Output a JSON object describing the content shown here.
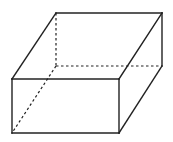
{
  "diagram": {
    "type": "cuboid-wireframe",
    "colors": {
      "background": "#ffffff",
      "stroke": "#222222"
    },
    "vertices": {
      "front_top_left": [
        12,
        79
      ],
      "front_top_right": [
        119,
        79
      ],
      "front_bottom_left": [
        12,
        133
      ],
      "front_bottom_right": [
        119,
        133
      ],
      "back_top_left": [
        56,
        13
      ],
      "back_top_right": [
        162,
        13
      ],
      "back_bottom_left": [
        56,
        66
      ],
      "back_bottom_right": [
        162,
        66
      ]
    },
    "solid_edges": [
      [
        "front_top_left",
        "front_top_right"
      ],
      [
        "front_top_right",
        "front_bottom_right"
      ],
      [
        "front_bottom_right",
        "front_bottom_left"
      ],
      [
        "front_bottom_left",
        "front_top_left"
      ],
      [
        "back_top_left",
        "back_top_right"
      ],
      [
        "back_top_right",
        "back_bottom_right"
      ],
      [
        "front_top_left",
        "back_top_left"
      ],
      [
        "front_top_right",
        "back_top_right"
      ],
      [
        "front_bottom_right",
        "back_bottom_right"
      ]
    ],
    "dashed_edges": [
      [
        "back_top_left",
        "back_bottom_left"
      ],
      [
        "back_bottom_left",
        "back_bottom_right"
      ],
      [
        "back_bottom_left",
        "front_bottom_left"
      ]
    ]
  }
}
